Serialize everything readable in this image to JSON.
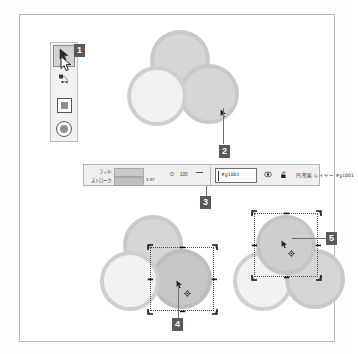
{
  "app": {
    "title": "Vector editor canvas"
  },
  "toolbox": {
    "name": "toolbox",
    "tools": [
      {
        "id": "selector",
        "label": "Selector tool",
        "icon": "arrow-cursor-icon",
        "active": true
      },
      {
        "id": "node",
        "label": "Node editor tool",
        "icon": "node-editor-icon",
        "active": false
      },
      {
        "id": "rectangle",
        "label": "Rectangle tool",
        "icon": "rectangle-icon",
        "active": false
      },
      {
        "id": "ellipse",
        "label": "Ellipse tool",
        "icon": "ellipse-icon",
        "active": false
      }
    ]
  },
  "badges": [
    {
      "number": "1",
      "target": "selector-tool"
    },
    {
      "number": "2",
      "target": "right-circle-top-group"
    },
    {
      "number": "3",
      "target": "status-bar-id-field"
    },
    {
      "number": "4",
      "target": "right-circle-selected-bottom-left-group"
    },
    {
      "number": "5",
      "target": "top-circle-selected-bottom-right-group"
    }
  ],
  "statusbar": {
    "fill_label": "フィル:",
    "stroke_label": "ストローク:",
    "stroke_width": "3.87",
    "opacity_label": "O:",
    "opacity_value": "100",
    "id_value": "#g1001",
    "eye_icon": "visibility-eye-icon",
    "lock_icon": "lock-open-icon",
    "description": "円 所属 レイヤー #g1001",
    "fill_color": "#c9c9c9",
    "stroke_color": "#c0c0c0"
  },
  "canvas": {
    "groups": [
      {
        "id": "group-top",
        "label": "Top circle group (unselected)",
        "circles": [
          {
            "id": "top-circle",
            "fill": "#d6d6d6",
            "stroke": "#c9c9c9",
            "selected": false
          },
          {
            "id": "left-circle",
            "fill": "#f1f1f1",
            "stroke": "#cfcfcf",
            "selected": false
          },
          {
            "id": "right-circle",
            "fill": "#d6d6d6",
            "stroke": "#c9c9c9",
            "selected": false
          }
        ],
        "cursor": "arrow-cursor-icon"
      },
      {
        "id": "group-bottom-left",
        "label": "Bottom-left group, right circle selected",
        "circles": [
          {
            "id": "top-circle",
            "fill": "#d6d6d6",
            "stroke": "#c9c9c9",
            "selected": false
          },
          {
            "id": "left-circle",
            "fill": "#f1f1f1",
            "stroke": "#cfcfcf",
            "selected": false
          },
          {
            "id": "right-circle",
            "fill": "#c6c6c6",
            "stroke": "#bdbdbd",
            "selected": true
          }
        ],
        "selection_handles": 8,
        "rotation_center": true,
        "cursor": "arrow-cursor-icon"
      },
      {
        "id": "group-bottom-right",
        "label": "Bottom-right group, top circle selected",
        "circles": [
          {
            "id": "top-circle",
            "fill": "#cfcfcf",
            "stroke": "#c4c4c4",
            "selected": true
          },
          {
            "id": "left-circle",
            "fill": "#f1f1f1",
            "stroke": "#cfcfcf",
            "selected": false
          },
          {
            "id": "right-circle",
            "fill": "#d6d6d6",
            "stroke": "#c9c9c9",
            "selected": false
          }
        ],
        "selection_handles": 8,
        "rotation_center": true,
        "cursor": "arrow-cursor-icon"
      }
    ]
  },
  "colors": {
    "badge_bg": "#595959",
    "badge_fg": "#ffffff",
    "frame_border": "#b9b9b9",
    "toolbox_bg": "#f2f2f2",
    "statusbar_bg": "#efefef"
  }
}
